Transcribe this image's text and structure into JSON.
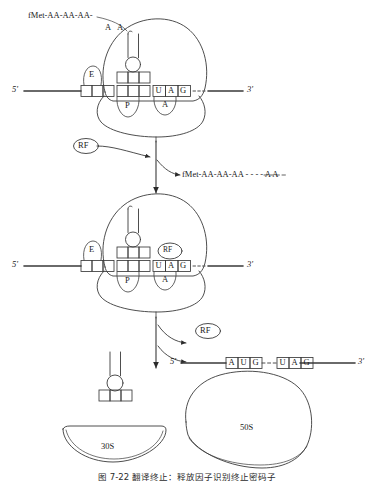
{
  "figure": {
    "domain": "molecular-biology-diagram",
    "title_caption": "图 7-22  翻译终止：释放因子识别终止密码子",
    "caption_visible_note": "caption clipped at bottom edge"
  },
  "stage1": {
    "name": "elongating-ribosome",
    "peptide_label": "fMet-AA-AA-AA-",
    "trna_amino_acids": [
      "A",
      "A"
    ],
    "sites": {
      "e": "E",
      "p": "P",
      "a": "A"
    },
    "stop_codon": [
      "U",
      "A",
      "G"
    ],
    "mrna_five_prime": "5'",
    "mrna_three_prime": "3'"
  },
  "step1": {
    "factor_label": "RF",
    "released_peptide": "fMet-AA-AA-AA - - - - A A"
  },
  "stage2": {
    "name": "ribosome-with-rf-bound",
    "sites": {
      "e": "E",
      "p": "P",
      "a": "A"
    },
    "factor_label": "RF",
    "stop_codon": [
      "U",
      "A",
      "G"
    ],
    "mrna_five_prime": "5'",
    "mrna_three_prime": "3'"
  },
  "step2": {
    "factor_label": "RF"
  },
  "stage3": {
    "name": "dissociated-components",
    "mrna": {
      "five_prime": "5'",
      "three_prime": "3'",
      "start_codon": [
        "A",
        "U",
        "G"
      ],
      "stop_codon": [
        "U",
        "A",
        "G"
      ]
    },
    "small_subunit": "30S",
    "large_subunit": "50S",
    "trna_label": ""
  }
}
